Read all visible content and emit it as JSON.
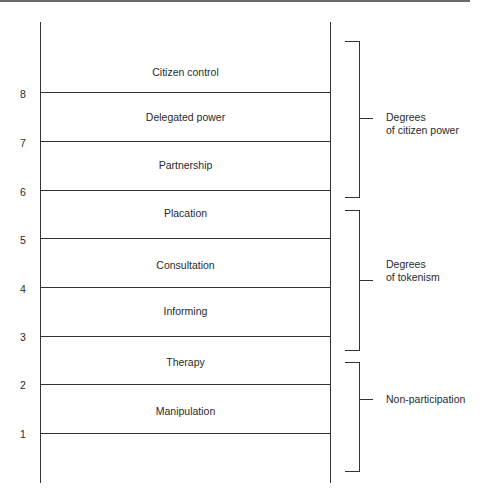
{
  "diagram": {
    "rungs": [
      {
        "number": "8",
        "label": "Citizen control"
      },
      {
        "number": "7",
        "label": "Delegated power"
      },
      {
        "number": "6",
        "label": "Partnership"
      },
      {
        "number": "5",
        "label": "Placation"
      },
      {
        "number": "4",
        "label": "Consultation"
      },
      {
        "number": "3",
        "label": "Informing"
      },
      {
        "number": "2",
        "label": "Therapy"
      },
      {
        "number": "1",
        "label": "Manipulation"
      }
    ],
    "groups": [
      {
        "line1": "Degrees",
        "line2": "of citizen power"
      },
      {
        "line1": "Degrees",
        "line2": "of tokenism"
      },
      {
        "line1": "Non-participation",
        "line2": ""
      }
    ]
  }
}
